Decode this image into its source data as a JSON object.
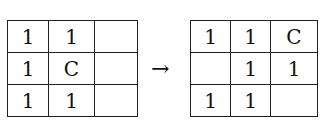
{
  "before_grid": {
    "rows": [
      [
        "1",
        "1",
        ""
      ],
      [
        "1",
        "C",
        ""
      ],
      [
        "1",
        "1",
        ""
      ]
    ]
  },
  "arrow": "→",
  "after_grid": {
    "rows": [
      [
        "1",
        "1",
        "C"
      ],
      [
        "",
        "1",
        "1"
      ],
      [
        "1",
        "1",
        ""
      ]
    ]
  }
}
